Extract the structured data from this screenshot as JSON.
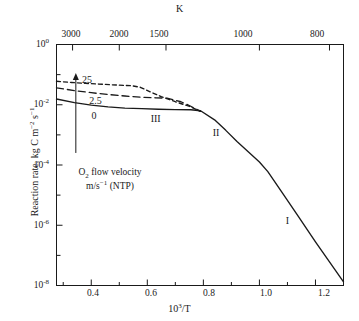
{
  "figure": {
    "background": "#ffffff",
    "line_color": "#1a1a1a",
    "axis_color": "#1a1a1a"
  },
  "chart_data": {
    "type": "line",
    "title": "",
    "xlabel": "10³/T",
    "ylabel": "Reaction rate, kg C m⁻² s⁻¹",
    "top_axis_label": "K",
    "xlim": [
      0.276,
      1.3
    ],
    "ylim_log10": [
      -8,
      0
    ],
    "grid": false,
    "legend": "inline curve labels",
    "x_ticks": [
      0.4,
      0.6,
      0.8,
      1.0,
      1.2
    ],
    "x_tick_labels": [
      "0.4",
      "0.6",
      "0.8",
      "1.0",
      "1.2"
    ],
    "y_ticks_log10": [
      0,
      -2,
      -4,
      -6,
      -8
    ],
    "y_tick_labels": [
      "10",
      "10",
      "10",
      "10",
      "10"
    ],
    "y_tick_exponents": [
      "0",
      "-2",
      "-4",
      "-6",
      "-8"
    ],
    "top_ticks_kelvin": [
      3000,
      2000,
      1500,
      1000,
      800
    ],
    "top_tick_labels": [
      "3000",
      "2000",
      "1500",
      "1000",
      "800"
    ],
    "series": [
      {
        "name": "O2 flow velocity 0 m/s (NTP)",
        "label": "0",
        "style": "solid",
        "points": [
          [
            0.276,
            -1.81
          ],
          [
            0.34,
            -1.93
          ],
          [
            0.4,
            -2.01
          ],
          [
            0.46,
            -2.07
          ],
          [
            0.52,
            -2.11
          ],
          [
            0.58,
            -2.13
          ],
          [
            0.64,
            -2.15
          ],
          [
            0.7,
            -2.16
          ],
          [
            0.755,
            -2.165
          ],
          [
            0.79,
            -2.2
          ],
          [
            0.84,
            -2.5
          ],
          [
            0.88,
            -2.85
          ],
          [
            0.92,
            -3.22
          ],
          [
            0.96,
            -3.56
          ],
          [
            1.0,
            -3.9
          ],
          [
            1.03,
            -4.22
          ],
          [
            1.08,
            -4.9
          ],
          [
            1.14,
            -5.72
          ],
          [
            1.2,
            -6.55
          ],
          [
            1.26,
            -7.35
          ],
          [
            1.3,
            -7.88
          ]
        ]
      },
      {
        "name": "O2 flow velocity 2.5 m/s (NTP)",
        "label": "2.5",
        "style": "long-dash",
        "points": [
          [
            0.276,
            -1.44
          ],
          [
            0.34,
            -1.53
          ],
          [
            0.4,
            -1.6
          ],
          [
            0.46,
            -1.66
          ],
          [
            0.52,
            -1.71
          ],
          [
            0.58,
            -1.75
          ],
          [
            0.63,
            -1.77
          ],
          [
            0.67,
            -1.78
          ],
          [
            0.72,
            -1.9
          ],
          [
            0.755,
            -2.05
          ],
          [
            0.79,
            -2.22
          ]
        ]
      },
      {
        "name": "O2 flow velocity 25 m/s (NTP)",
        "label": "25",
        "style": "short-dash",
        "points": [
          [
            0.276,
            -1.22
          ],
          [
            0.33,
            -1.26
          ],
          [
            0.38,
            -1.29
          ],
          [
            0.44,
            -1.32
          ],
          [
            0.5,
            -1.35
          ],
          [
            0.545,
            -1.37
          ],
          [
            0.575,
            -1.42
          ],
          [
            0.61,
            -1.57
          ],
          [
            0.65,
            -1.73
          ],
          [
            0.7,
            -1.9
          ],
          [
            0.755,
            -2.07
          ],
          [
            0.79,
            -2.22
          ]
        ]
      }
    ],
    "region_labels": [
      {
        "text": "I",
        "x": 1.1,
        "y_log10": -5.85
      },
      {
        "text": "II",
        "x": 0.845,
        "y_log10": -2.92
      },
      {
        "text": "III",
        "x": 0.63,
        "y_log10": -2.46
      }
    ],
    "curve_labels": [
      {
        "text": "25",
        "x": 0.385,
        "y_log10": -1.17
      },
      {
        "text": "2.5",
        "x": 0.415,
        "y_log10": -1.88
      },
      {
        "text": "0",
        "x": 0.41,
        "y_log10": -2.36
      }
    ],
    "annotation": {
      "line1": "O2 flow velocity",
      "line1_html": "O<sub>2</sub> flow velocity",
      "line2": "m/s-1 (NTP)",
      "line2_html": "m/s<sup>−1</sup> (NTP)",
      "arrow": "upward-arrow",
      "arrow_x": 0.345,
      "arrow_y_bottom_log10": -3.6,
      "arrow_y_top_log10": -0.95
    }
  }
}
